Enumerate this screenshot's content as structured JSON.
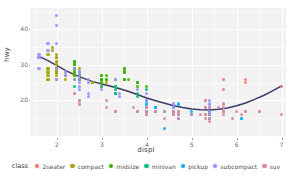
{
  "chart_data": {
    "type": "scatter",
    "title": "",
    "xlabel": "displ",
    "ylabel": "hwy",
    "xlim": [
      1.4,
      7.1
    ],
    "ylim": [
      10,
      46
    ],
    "xticks": [
      2,
      3,
      4,
      5,
      6,
      7
    ],
    "yticks": [
      20,
      30,
      40
    ],
    "grid": true,
    "legend_position": "bottom",
    "legend_title": "class",
    "panel_background": "#f2f2f2",
    "gridline_color": "#ffffff",
    "smooth": {
      "type": "loess",
      "color": "#3b3b63",
      "x": [
        1.6,
        1.8,
        2.0,
        2.2,
        2.4,
        2.6,
        2.8,
        3.0,
        3.2,
        3.4,
        3.6,
        3.8,
        4.0,
        4.2,
        4.4,
        4.6,
        4.8,
        5.0,
        5.2,
        5.4,
        5.6,
        5.8,
        6.0,
        6.2,
        6.4,
        6.6,
        6.8,
        7.0
      ],
      "y": [
        32.4,
        31.2,
        29.8,
        28.4,
        27.2,
        26.2,
        25.3,
        24.6,
        24.0,
        23.3,
        22.5,
        21.6,
        20.7,
        19.9,
        19.2,
        18.5,
        18.0,
        17.6,
        17.4,
        17.3,
        17.5,
        17.9,
        18.5,
        19.3,
        20.3,
        21.4,
        22.7,
        24.1
      ]
    },
    "series": [
      {
        "name": "2seater",
        "color": "#F8766D",
        "points": [
          [
            5.7,
            26
          ],
          [
            5.7,
            23
          ],
          [
            6.2,
            26
          ],
          [
            6.2,
            25
          ],
          [
            7.0,
            24
          ]
        ]
      },
      {
        "name": "compact",
        "color": "#A3A500",
        "points": [
          [
            1.8,
            29
          ],
          [
            1.8,
            29
          ],
          [
            2.0,
            31
          ],
          [
            2.0,
            30
          ],
          [
            1.8,
            26
          ],
          [
            1.8,
            26
          ],
          [
            2.0,
            27
          ],
          [
            2.0,
            26
          ],
          [
            2.8,
            25
          ],
          [
            2.8,
            25
          ],
          [
            3.1,
            25
          ],
          [
            1.8,
            28
          ],
          [
            1.8,
            27
          ],
          [
            2.0,
            29
          ],
          [
            2.0,
            28
          ],
          [
            2.0,
            31
          ],
          [
            2.0,
            30
          ],
          [
            2.4,
            28
          ],
          [
            2.4,
            27
          ],
          [
            2.5,
            27
          ],
          [
            2.5,
            26
          ],
          [
            2.5,
            27
          ],
          [
            2.5,
            28
          ],
          [
            2.5,
            29
          ],
          [
            2.5,
            26
          ],
          [
            2.2,
            27
          ],
          [
            2.2,
            26
          ],
          [
            2.4,
            27
          ],
          [
            2.4,
            26
          ],
          [
            3.0,
            25
          ],
          [
            3.0,
            24
          ],
          [
            3.3,
            24
          ],
          [
            2.0,
            33
          ],
          [
            2.0,
            32
          ],
          [
            2.0,
            29
          ],
          [
            2.0,
            28
          ],
          [
            2.8,
            25
          ],
          [
            1.9,
            35
          ],
          [
            1.9,
            34
          ],
          [
            1.8,
            33
          ],
          [
            2.0,
            32
          ],
          [
            2.0,
            29
          ],
          [
            2.0,
            28
          ],
          [
            2.0,
            29
          ],
          [
            2.0,
            29
          ],
          [
            2.0,
            28
          ],
          [
            2.0,
            29
          ]
        ]
      },
      {
        "name": "midsize",
        "color": "#39B600",
        "points": [
          [
            2.4,
            31
          ],
          [
            3.0,
            27
          ],
          [
            3.0,
            26
          ],
          [
            3.5,
            28
          ],
          [
            2.4,
            30
          ],
          [
            2.4,
            31
          ],
          [
            2.4,
            27
          ],
          [
            3.1,
            26
          ],
          [
            3.5,
            29
          ],
          [
            2.4,
            31
          ],
          [
            2.4,
            30
          ],
          [
            3.0,
            26
          ],
          [
            3.0,
            26
          ],
          [
            3.3,
            26
          ],
          [
            3.8,
            25
          ],
          [
            3.5,
            28
          ],
          [
            3.5,
            29
          ],
          [
            2.5,
            27
          ],
          [
            2.5,
            26
          ],
          [
            2.4,
            29
          ],
          [
            2.4,
            30
          ],
          [
            3.5,
            26
          ],
          [
            3.6,
            26
          ],
          [
            3.0,
            27
          ],
          [
            3.0,
            26
          ],
          [
            3.5,
            26
          ],
          [
            2.4,
            28
          ],
          [
            2.4,
            29
          ],
          [
            3.1,
            27
          ],
          [
            3.1,
            26
          ],
          [
            3.5,
            26
          ],
          [
            3.8,
            25
          ],
          [
            3.8,
            25
          ],
          [
            3.8,
            24
          ],
          [
            4.0,
            24
          ],
          [
            2.5,
            26
          ],
          [
            2.5,
            27
          ],
          [
            3.0,
            26
          ],
          [
            3.0,
            25
          ],
          [
            3.3,
            24
          ],
          [
            3.8,
            25
          ]
        ]
      },
      {
        "name": "minivan",
        "color": "#00BF7D",
        "points": [
          [
            2.4,
            24
          ],
          [
            3.0,
            24
          ],
          [
            3.3,
            22
          ],
          [
            3.3,
            22
          ],
          [
            3.3,
            24
          ],
          [
            3.3,
            24
          ],
          [
            3.3,
            17
          ],
          [
            3.8,
            22
          ],
          [
            3.8,
            21
          ],
          [
            4.0,
            23
          ],
          [
            3.3,
            23
          ],
          [
            3.3,
            22
          ]
        ]
      },
      {
        "name": "pickup",
        "color": "#00B0F6",
        "points": [
          [
            4.7,
            19
          ],
          [
            5.7,
            17
          ],
          [
            5.7,
            17
          ],
          [
            6.1,
            15
          ],
          [
            4.0,
            17
          ],
          [
            4.2,
            17
          ],
          [
            4.4,
            12
          ],
          [
            4.6,
            17
          ],
          [
            5.4,
            16
          ],
          [
            5.4,
            15
          ],
          [
            4.0,
            18
          ],
          [
            4.0,
            17
          ],
          [
            4.6,
            17
          ],
          [
            5.0,
            16
          ],
          [
            4.2,
            18
          ],
          [
            4.4,
            17
          ],
          [
            4.6,
            17
          ],
          [
            5.4,
            17
          ],
          [
            5.4,
            16
          ],
          [
            4.0,
            19
          ],
          [
            4.0,
            20
          ],
          [
            4.6,
            18
          ],
          [
            5.0,
            17
          ],
          [
            4.2,
            18
          ],
          [
            4.2,
            17
          ],
          [
            4.6,
            17
          ],
          [
            4.6,
            16
          ],
          [
            5.4,
            15
          ],
          [
            5.4,
            16
          ],
          [
            4.7,
            16
          ],
          [
            4.7,
            15
          ],
          [
            5.7,
            17
          ],
          [
            6.1,
            15
          ]
        ]
      },
      {
        "name": "subcompact",
        "color": "#9590FF",
        "points": [
          [
            1.6,
            33
          ],
          [
            1.6,
            32
          ],
          [
            1.6,
            32
          ],
          [
            1.6,
            29
          ],
          [
            1.6,
            32
          ],
          [
            1.8,
            34
          ],
          [
            1.8,
            36
          ],
          [
            2.0,
            36
          ],
          [
            2.4,
            29
          ],
          [
            2.4,
            26
          ],
          [
            2.5,
            28
          ],
          [
            2.5,
            27
          ],
          [
            3.3,
            26
          ],
          [
            2.0,
            44
          ],
          [
            2.0,
            41
          ],
          [
            2.0,
            29
          ],
          [
            2.0,
            26
          ],
          [
            2.2,
            28
          ],
          [
            2.2,
            27
          ],
          [
            2.5,
            26
          ],
          [
            2.5,
            25
          ],
          [
            2.5,
            24
          ],
          [
            2.7,
            26
          ],
          [
            2.7,
            25
          ],
          [
            3.0,
            23
          ],
          [
            3.4,
            22
          ],
          [
            3.4,
            21
          ],
          [
            3.8,
            23
          ],
          [
            4.0,
            22
          ],
          [
            4.0,
            20
          ],
          [
            4.6,
            19
          ],
          [
            4.6,
            18
          ],
          [
            5.4,
            20
          ],
          [
            5.4,
            19
          ],
          [
            5.4,
            18
          ],
          [
            5.4,
            17
          ],
          [
            2.5,
            23
          ],
          [
            2.5,
            20
          ],
          [
            2.7,
            22
          ],
          [
            2.7,
            21
          ]
        ]
      },
      {
        "name": "suv",
        "color": "#D989A2",
        "points": [
          [
            5.3,
            20
          ],
          [
            5.3,
            15
          ],
          [
            5.3,
            20
          ],
          [
            5.7,
            17
          ],
          [
            6.0,
            17
          ],
          [
            5.7,
            19
          ],
          [
            5.7,
            18
          ],
          [
            6.2,
            17
          ],
          [
            6.2,
            17
          ],
          [
            7.0,
            16
          ],
          [
            5.3,
            18
          ],
          [
            5.3,
            18
          ],
          [
            5.7,
            17
          ],
          [
            6.5,
            17
          ],
          [
            2.4,
            22
          ],
          [
            2.4,
            22
          ],
          [
            3.1,
            20
          ],
          [
            3.7,
            18
          ],
          [
            4.0,
            18
          ],
          [
            4.7,
            17
          ],
          [
            4.7,
            16
          ],
          [
            4.7,
            17
          ],
          [
            5.2,
            16
          ],
          [
            5.7,
            16
          ],
          [
            5.9,
            15
          ],
          [
            4.0,
            17
          ],
          [
            4.0,
            17
          ],
          [
            4.6,
            16
          ],
          [
            5.0,
            16
          ],
          [
            4.2,
            17
          ],
          [
            4.2,
            17
          ],
          [
            4.4,
            15
          ],
          [
            4.6,
            16
          ],
          [
            5.4,
            15
          ],
          [
            5.4,
            14
          ],
          [
            3.8,
            17
          ],
          [
            3.8,
            17
          ],
          [
            4.0,
            16
          ],
          [
            4.0,
            16
          ],
          [
            4.6,
            17
          ],
          [
            4.6,
            17
          ],
          [
            5.4,
            18
          ],
          [
            4.7,
            16
          ],
          [
            5.7,
            17
          ],
          [
            6.1,
            16
          ],
          [
            4.0,
            18
          ],
          [
            4.2,
            17
          ],
          [
            4.4,
            17
          ],
          [
            4.6,
            16
          ],
          [
            5.4,
            16
          ],
          [
            3.3,
            17
          ],
          [
            3.3,
            17
          ],
          [
            4.0,
            16
          ],
          [
            5.6,
            18
          ],
          [
            3.1,
            18
          ],
          [
            3.8,
            17
          ],
          [
            4.7,
            15
          ],
          [
            5.3,
            16
          ],
          [
            5.3,
            16
          ],
          [
            5.7,
            17
          ],
          [
            6.5,
            17
          ],
          [
            2.5,
            20
          ],
          [
            2.5,
            19
          ]
        ]
      }
    ]
  },
  "axes": {
    "x": {
      "label": "displ",
      "ticks": [
        "2",
        "3",
        "4",
        "5",
        "6",
        "7"
      ]
    },
    "y": {
      "label": "hwy",
      "ticks": [
        "20",
        "30",
        "40"
      ]
    }
  },
  "legend": {
    "title": "class",
    "items": [
      {
        "label": "2seater",
        "color": "#F8766D"
      },
      {
        "label": "compact",
        "color": "#A3A500"
      },
      {
        "label": "midsize",
        "color": "#39B600"
      },
      {
        "label": "minivan",
        "color": "#00BF7D"
      },
      {
        "label": "pickup",
        "color": "#00B0F6"
      },
      {
        "label": "subcompact",
        "color": "#9590FF"
      },
      {
        "label": "suv",
        "color": "#D989A2"
      }
    ]
  }
}
